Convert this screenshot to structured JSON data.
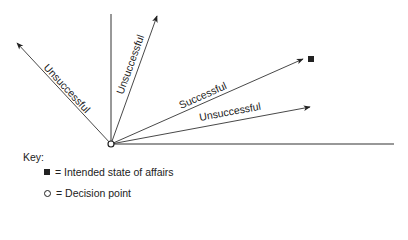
{
  "diagram": {
    "origin": {
      "x": 111,
      "y": 144
    },
    "axes": {
      "horizontal_end": {
        "x": 394,
        "y": 144
      },
      "vertical_end": {
        "x": 111,
        "y": 14
      }
    },
    "arrows": [
      {
        "id": "left",
        "label": "Unsuccessful",
        "tip": {
          "x": 17,
          "y": 43
        },
        "outcome": "unsuccessful"
      },
      {
        "id": "upper",
        "label": "Unsuccessful",
        "tip": {
          "x": 157,
          "y": 16
        },
        "outcome": "unsuccessful"
      },
      {
        "id": "target",
        "label": "Successful",
        "tip": {
          "x": 303,
          "y": 59
        },
        "outcome": "successful"
      },
      {
        "id": "lower",
        "label": "Unsuccessful",
        "tip": {
          "x": 310,
          "y": 107
        },
        "outcome": "unsuccessful"
      }
    ],
    "target_marker": {
      "x": 311,
      "y": 59
    }
  },
  "labels": {
    "arrow_left": "Unsuccessful",
    "arrow_upper": "Unsuccessful",
    "arrow_target": "Successful",
    "arrow_lower": "Unsuccessful"
  },
  "key": {
    "title": "Key:",
    "items": [
      {
        "symbol": "filled-square",
        "text": "= Intended state of affairs"
      },
      {
        "symbol": "open-circle",
        "text": "= Decision point"
      }
    ]
  },
  "colors": {
    "ink": "#222222",
    "background": "#ffffff"
  }
}
